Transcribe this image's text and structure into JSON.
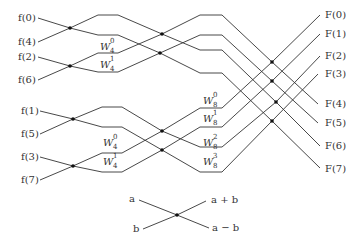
{
  "diagram": {
    "type": "fft-butterfly",
    "inputs": [
      {
        "label": "f(0)",
        "x": 4,
        "y": 13
      },
      {
        "label": "f(4)",
        "x": 4,
        "y": 37
      },
      {
        "label": "f(2)",
        "x": 4,
        "y": 52
      },
      {
        "label": "f(6)",
        "x": 4,
        "y": 75
      },
      {
        "label": "f(1)",
        "x": 7,
        "y": 106
      },
      {
        "label": "f(5)",
        "x": 7,
        "y": 129
      },
      {
        "label": "f(3)",
        "x": 7,
        "y": 152
      },
      {
        "label": "f(7)",
        "x": 7,
        "y": 175
      }
    ],
    "outputs": [
      {
        "label": "F(0)",
        "x": 323,
        "y": 10
      },
      {
        "label": "F(1)",
        "x": 323,
        "y": 29
      },
      {
        "label": "F(2)",
        "x": 323,
        "y": 51
      },
      {
        "label": "F(3)",
        "x": 323,
        "y": 70
      },
      {
        "label": "F(4)",
        "x": 323,
        "y": 100
      },
      {
        "label": "F(5)",
        "x": 323,
        "y": 119
      },
      {
        "label": "F(6)",
        "x": 323,
        "y": 141
      },
      {
        "label": "F(7)",
        "x": 323,
        "y": 164
      }
    ],
    "twiddles": [
      {
        "base": "W",
        "sup": "0",
        "sub": "4",
        "x": 100,
        "y": 41
      },
      {
        "base": "W",
        "sup": "1",
        "sub": "4",
        "x": 100,
        "y": 60
      },
      {
        "base": "W",
        "sup": "0",
        "sub": "4",
        "x": 103,
        "y": 137
      },
      {
        "base": "W",
        "sup": "1",
        "sub": "4",
        "x": 103,
        "y": 156
      },
      {
        "base": "W",
        "sup": "0",
        "sub": "8",
        "x": 203,
        "y": 96
      },
      {
        "base": "W",
        "sup": "1",
        "sub": "8",
        "x": 203,
        "y": 114
      },
      {
        "base": "W",
        "sup": "2",
        "sub": "8",
        "x": 203,
        "y": 140
      },
      {
        "base": "W",
        "sup": "3",
        "sub": "8",
        "x": 203,
        "y": 158
      }
    ],
    "legend": {
      "in_a": "a",
      "in_b": "b",
      "out_sum": "a + b",
      "out_diff": "a − b"
    }
  }
}
